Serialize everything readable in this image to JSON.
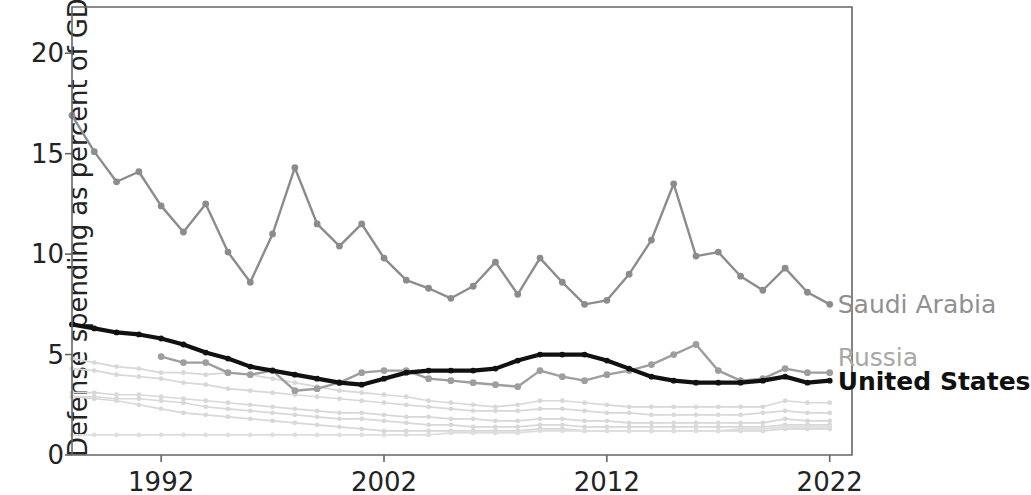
{
  "chart_data": {
    "type": "line",
    "title": "",
    "xlabel": "",
    "ylabel": "Defense spending as percent of GDP",
    "xlim": [
      1988,
      2023
    ],
    "ylim": [
      0,
      22.3
    ],
    "xticks": [
      1992,
      2002,
      2012,
      2022
    ],
    "yticks": [
      0,
      5,
      10,
      15,
      20
    ],
    "grid": false,
    "legend_position": "right-inline-labels",
    "x": [
      1988,
      1989,
      1990,
      1991,
      1992,
      1993,
      1994,
      1995,
      1996,
      1997,
      1998,
      1999,
      2000,
      2001,
      2002,
      2003,
      2004,
      2005,
      2006,
      2007,
      2008,
      2009,
      2010,
      2011,
      2012,
      2013,
      2014,
      2015,
      2016,
      2017,
      2018,
      2019,
      2020,
      2021,
      2022
    ],
    "series": [
      {
        "name": "Saudi Arabia",
        "color": "#8c8c8c",
        "highlight": true,
        "label_value": "Saudi Arabia",
        "values": [
          16.9,
          15.1,
          13.6,
          14.1,
          12.4,
          11.1,
          12.5,
          10.1,
          8.6,
          11.0,
          14.3,
          11.5,
          10.4,
          11.5,
          9.8,
          8.7,
          8.3,
          7.8,
          8.4,
          9.6,
          8.0,
          9.8,
          8.6,
          7.5,
          7.7,
          9.0,
          10.7,
          13.5,
          9.9,
          10.1,
          8.9,
          8.2,
          9.3,
          8.1,
          7.5
        ]
      },
      {
        "name": "Russia",
        "color": "#9e9e9e",
        "highlight": true,
        "label_value": "Russia",
        "values": [
          null,
          null,
          null,
          null,
          4.9,
          4.6,
          4.6,
          4.1,
          4.0,
          4.2,
          3.2,
          3.3,
          3.6,
          4.1,
          4.2,
          4.2,
          3.8,
          3.7,
          3.6,
          3.5,
          3.4,
          4.2,
          3.9,
          3.7,
          4.0,
          4.2,
          4.5,
          5.0,
          5.5,
          4.2,
          3.7,
          3.8,
          4.3,
          4.1,
          4.1
        ]
      },
      {
        "name": "United States",
        "color": "#111111",
        "highlight": true,
        "label_value": "United States",
        "values": [
          6.5,
          6.3,
          6.1,
          6.0,
          5.8,
          5.5,
          5.1,
          4.8,
          4.4,
          4.2,
          4.0,
          3.8,
          3.6,
          3.5,
          3.8,
          4.1,
          4.2,
          4.2,
          4.2,
          4.3,
          4.7,
          5.0,
          5.0,
          5.0,
          4.7,
          4.3,
          3.9,
          3.7,
          3.6,
          3.6,
          3.6,
          3.7,
          3.9,
          3.6,
          3.7
        ]
      },
      {
        "name": "background-1",
        "color": "#d8d8d8",
        "highlight": false,
        "values": [
          4.8,
          4.6,
          4.4,
          4.3,
          4.1,
          4.1,
          4.0,
          4.1,
          4.0,
          3.8,
          3.6,
          3.4,
          3.2,
          3.1,
          3.0,
          2.9,
          2.7,
          2.6,
          2.5,
          2.4,
          2.5,
          2.7,
          2.7,
          2.6,
          2.5,
          2.4,
          2.4,
          2.4,
          2.4,
          2.4,
          2.4,
          2.4,
          2.7,
          2.6,
          2.6
        ]
      },
      {
        "name": "background-2",
        "color": "#d8d8d8",
        "highlight": false,
        "values": [
          4.3,
          4.2,
          4.0,
          3.9,
          3.8,
          3.6,
          3.5,
          3.3,
          3.2,
          3.1,
          3.0,
          2.9,
          2.8,
          2.7,
          2.6,
          2.5,
          2.4,
          2.3,
          2.2,
          2.2,
          2.2,
          2.3,
          2.3,
          2.2,
          2.1,
          2.1,
          2.0,
          2.0,
          2.0,
          2.0,
          2.0,
          2.1,
          2.2,
          2.1,
          2.1
        ]
      },
      {
        "name": "background-3",
        "color": "#d8d8d8",
        "highlight": false,
        "values": [
          3.1,
          3.1,
          3.0,
          3.0,
          2.9,
          2.8,
          2.7,
          2.6,
          2.5,
          2.4,
          2.3,
          2.2,
          2.1,
          2.1,
          2.0,
          1.9,
          1.9,
          1.8,
          1.8,
          1.7,
          1.7,
          1.8,
          1.8,
          1.7,
          1.7,
          1.6,
          1.6,
          1.6,
          1.6,
          1.6,
          1.6,
          1.6,
          1.8,
          1.7,
          1.7
        ]
      },
      {
        "name": "background-4",
        "color": "#d8d8d8",
        "highlight": false,
        "values": [
          2.9,
          2.9,
          2.8,
          2.8,
          2.7,
          2.6,
          2.4,
          2.3,
          2.2,
          2.1,
          2.0,
          1.9,
          1.8,
          1.8,
          1.7,
          1.6,
          1.5,
          1.5,
          1.4,
          1.4,
          1.4,
          1.5,
          1.5,
          1.4,
          1.4,
          1.4,
          1.4,
          1.4,
          1.4,
          1.4,
          1.4,
          1.4,
          1.5,
          1.5,
          1.5
        ]
      },
      {
        "name": "background-5",
        "color": "#d8d8d8",
        "highlight": false,
        "values": [
          2.9,
          2.8,
          2.7,
          2.5,
          2.3,
          2.1,
          2.0,
          1.9,
          1.8,
          1.7,
          1.6,
          1.5,
          1.4,
          1.3,
          1.2,
          1.2,
          1.2,
          1.2,
          1.2,
          1.2,
          1.2,
          1.3,
          1.3,
          1.2,
          1.2,
          1.2,
          1.2,
          1.2,
          1.2,
          1.2,
          1.2,
          1.2,
          1.3,
          1.3,
          1.3
        ]
      },
      {
        "name": "background-6",
        "color": "#dedede",
        "highlight": false,
        "values": [
          1.0,
          1.0,
          1.0,
          1.0,
          1.0,
          1.0,
          1.0,
          1.0,
          1.0,
          1.0,
          1.0,
          1.0,
          1.0,
          1.0,
          1.0,
          1.0,
          1.0,
          1.1,
          1.1,
          1.1,
          1.1,
          1.2,
          1.2,
          1.2,
          1.2,
          1.2,
          1.2,
          1.2,
          1.2,
          1.2,
          1.3,
          1.3,
          1.4,
          1.4,
          1.4
        ]
      }
    ],
    "inline_labels": [
      {
        "text": "Saudi Arabia",
        "year": 2022,
        "value": 7.5,
        "color": "#909090",
        "bold": false
      },
      {
        "text": "Russia",
        "year": 2022,
        "value": 4.9,
        "color": "#a8a8a8",
        "bold": false
      },
      {
        "text": "United States",
        "year": 2022,
        "value": 3.7,
        "color": "#111111",
        "bold": true
      }
    ]
  },
  "axis": {
    "ylabel": "Defense spending as percent of GDP",
    "xtick_labels": [
      "1992",
      "2002",
      "2012",
      "2022"
    ],
    "ytick_labels": [
      "0",
      "5",
      "10",
      "15",
      "20"
    ]
  },
  "labels": {
    "saudi_arabia": "Saudi Arabia",
    "russia": "Russia",
    "united_states": "United States"
  },
  "colors": {
    "saudi": "#8c8c8c",
    "russia": "#9e9e9e",
    "united_states": "#111111",
    "background_lines": "#d8d8d8",
    "axis": "#555555",
    "text": "#232323"
  }
}
